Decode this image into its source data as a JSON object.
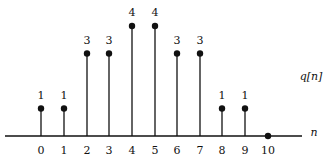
{
  "chart_data": {
    "type": "stem",
    "title": "",
    "xlabel": "n",
    "ylabel": "q[n]",
    "x": [
      0,
      1,
      2,
      3,
      4,
      5,
      6,
      7,
      8,
      9,
      10
    ],
    "values": [
      1,
      1,
      3,
      3,
      4,
      4,
      3,
      3,
      1,
      1,
      0
    ],
    "value_labels": [
      "1",
      "1",
      "3",
      "3",
      "4",
      "4",
      "3",
      "3",
      "1",
      "1",
      ""
    ],
    "tick_labels": [
      "0",
      "1",
      "2",
      "3",
      "4",
      "5",
      "6",
      "7",
      "8",
      "9",
      "10"
    ],
    "grid": false,
    "legend": null
  },
  "layout": {
    "x_positions": [
      41,
      64,
      87,
      109,
      132,
      155,
      177,
      200,
      222,
      245,
      268
    ],
    "baseline_y": 136,
    "unit_px": 27.5,
    "axis_x_start": 5,
    "axis_x_end": 302
  }
}
